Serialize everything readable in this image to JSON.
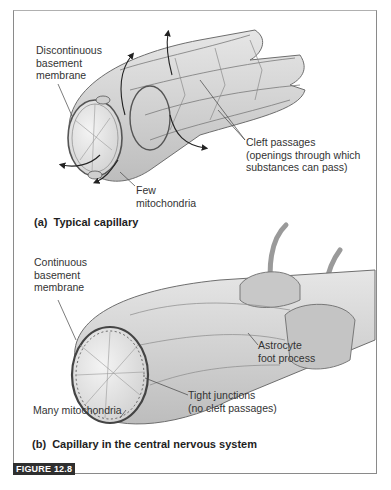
{
  "figure": {
    "badge": "FIGURE 12.8",
    "panels": [
      {
        "caption": "(a)  Typical capillary",
        "labels": {
          "basement_line1": "Discontinuous",
          "basement_line2": "basement",
          "basement_line3": "membrane",
          "cleft_line1": "Cleft passages",
          "cleft_line2": "(openings through which",
          "cleft_line3": "substances can pass)",
          "mito_line1": "Few",
          "mito_line2": "mitochondria"
        }
      },
      {
        "caption": "(b)  Capillary in the central nervous system",
        "labels": {
          "basement_line1": "Continuous",
          "basement_line2": "basement",
          "basement_line3": "membrane",
          "astro_line1": "Astrocyte",
          "astro_line2": "foot process",
          "tight_line1": "Tight junctions",
          "tight_line2": "(no cleft passages)",
          "mito": "Many mitochondria"
        }
      }
    ],
    "colors": {
      "tissue_fill": "#d9d9d9",
      "tissue_light": "#ececec",
      "tissue_line": "#6e6e6e",
      "badge_bg": "#2f2f2f",
      "frame": "#8a8a8a"
    }
  }
}
